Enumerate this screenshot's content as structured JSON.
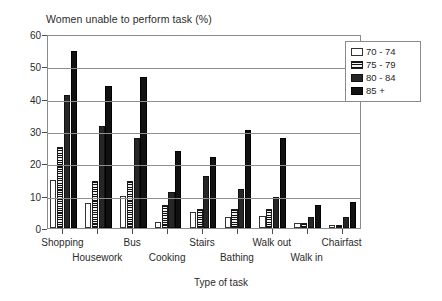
{
  "chart_data": {
    "type": "bar",
    "title": "Women unable to perform task (%)",
    "xlabel": "Type of task",
    "ylabel": "",
    "ylim": [
      0,
      60
    ],
    "yticks": [
      0,
      10,
      20,
      30,
      40,
      50,
      60
    ],
    "grid": true,
    "legend_position": "top-right",
    "categories": [
      "Shopping",
      "Housework",
      "Bus",
      "Cooking",
      "Stairs",
      "Bathing",
      "Walk out",
      "Walk in",
      "Chairfast"
    ],
    "series": [
      {
        "name": "70 - 74",
        "values": [
          14.8,
          7.8,
          10.0,
          2.0,
          5.0,
          3.4,
          3.8,
          1.5,
          0.8
        ]
      },
      {
        "name": "75 - 79",
        "values": [
          25.0,
          14.5,
          14.5,
          7.0,
          6.0,
          5.8,
          6.0,
          1.5,
          1.0
        ]
      },
      {
        "name": "80 - 84",
        "values": [
          41.0,
          31.5,
          27.8,
          11.0,
          16.0,
          12.0,
          9.5,
          3.5,
          3.5
        ]
      },
      {
        "name": "85 +",
        "values": [
          54.8,
          44.0,
          46.8,
          23.8,
          22.0,
          30.2,
          27.7,
          7.2,
          8.1
        ]
      }
    ]
  },
  "legend": {
    "entries": [
      {
        "label": "70 - 74",
        "swatch": "white-open-square"
      },
      {
        "label": "75 - 79",
        "swatch": "horizontal-striped-square"
      },
      {
        "label": "80 - 84",
        "swatch": "dark-gray-square"
      },
      {
        "label": "85 +",
        "swatch": "black-square"
      }
    ]
  },
  "colors": {
    "series_70_74": "#ffffff",
    "series_75_79": "#2a2a2a",
    "series_80_84": "#262626",
    "series_85_plus": "#111111",
    "axis": "#8a8a8a",
    "grid": "#8e8e8e",
    "text": "#2b2b2b"
  }
}
